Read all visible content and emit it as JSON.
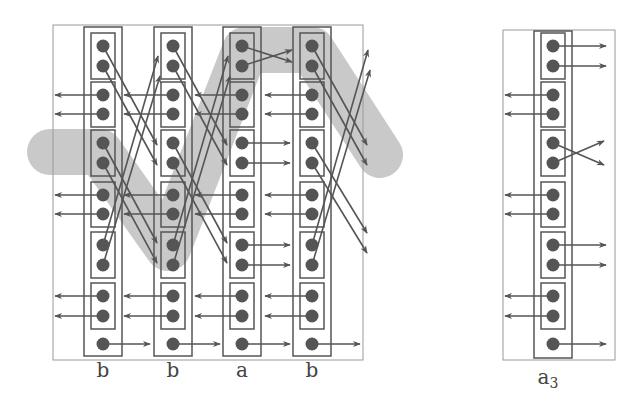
{
  "colors": {
    "band": "#c9c9c9",
    "line": "#555555",
    "frame": "#9a9a9a",
    "dot": "#555555"
  },
  "left_diagram": {
    "columns": [
      {
        "label": "b",
        "x": 103
      },
      {
        "label": "b",
        "x": 173
      },
      {
        "label": "a",
        "x": 242
      },
      {
        "label": "b",
        "x": 312
      }
    ]
  },
  "right_diagram": {
    "columns": [
      {
        "label": "a",
        "subscript": "3",
        "x": 553
      }
    ]
  },
  "rows": {
    "dot_y": [
      46,
      66,
      95,
      114,
      143,
      163,
      195,
      214,
      245,
      265,
      296,
      316,
      344
    ],
    "pairs": [
      [
        46,
        66
      ],
      [
        95,
        114
      ],
      [
        143,
        163
      ],
      [
        195,
        214
      ],
      [
        245,
        265
      ],
      [
        296,
        316
      ]
    ],
    "single": 344
  }
}
